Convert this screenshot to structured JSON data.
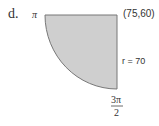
{
  "figure": {
    "label": "d.",
    "angle_start_label": "π",
    "corner_label": "(75,60)",
    "radius_label": "r = 70",
    "angle_end_numerator": "3π",
    "angle_end_denominator": "2",
    "fill_color": "#cfcfcf",
    "stroke_color": "#777777"
  }
}
